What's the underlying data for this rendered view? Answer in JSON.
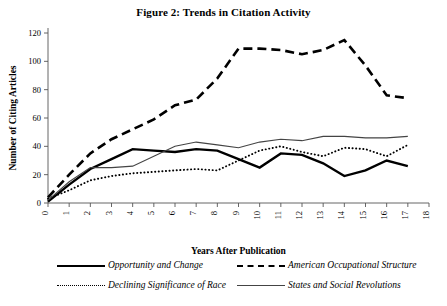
{
  "chart_data": {
    "type": "line",
    "title": "Figure 2: Trends in Citation Activity",
    "xlabel": "Years After Publication",
    "ylabel": "Number of Citing Articles",
    "xlim": [
      0,
      18
    ],
    "ylim": [
      0,
      120
    ],
    "xticks": [
      0,
      1,
      2,
      3,
      4,
      5,
      6,
      7,
      8,
      9,
      10,
      11,
      12,
      13,
      14,
      15,
      16,
      17,
      18
    ],
    "yticks": [
      0,
      20,
      40,
      60,
      80,
      100,
      120
    ],
    "xtick_labels": [
      "0",
      "1",
      "2",
      "3",
      "4",
      "5",
      "6",
      "7",
      "8",
      "9",
      "10",
      "11",
      "12",
      "13",
      "14",
      "15",
      "16",
      "17",
      "18"
    ],
    "ytick_labels": [
      "0",
      "20",
      "40",
      "60",
      "80",
      "100",
      "120"
    ],
    "grid": false,
    "legend_position": "below",
    "x": [
      0,
      1,
      2,
      3,
      4,
      5,
      6,
      7,
      8,
      9,
      10,
      11,
      12,
      13,
      14,
      15,
      16,
      17
    ],
    "series": [
      {
        "name": "Opportunity and Change",
        "style": "thick-solid",
        "color": "#000000",
        "values": [
          1,
          13,
          24,
          31,
          38,
          37,
          36,
          38,
          37,
          31,
          25,
          35,
          34,
          28,
          19,
          23,
          30,
          26
        ]
      },
      {
        "name": "American Occupational Structure",
        "style": "thick-dashed",
        "color": "#000000",
        "values": [
          4,
          20,
          35,
          45,
          52,
          59,
          69,
          73,
          88,
          109,
          109,
          108,
          105,
          108,
          115,
          97,
          76,
          74
        ]
      },
      {
        "name": "Declining Significance of Race",
        "style": "dotted",
        "color": "#000000",
        "values": [
          3,
          9,
          16,
          19,
          21,
          22,
          23,
          24,
          23,
          30,
          37,
          40,
          36,
          33,
          39,
          38,
          33,
          41
        ]
      },
      {
        "name": "States and Social Revolutions",
        "style": "thin-solid",
        "color": "#444444",
        "values": [
          2,
          15,
          25,
          25,
          26,
          33,
          40,
          43,
          41,
          39,
          43,
          45,
          44,
          47,
          47,
          46,
          46,
          47
        ]
      }
    ]
  },
  "legend": {
    "entries": [
      {
        "label": "Opportunity and Change",
        "style": "thick-solid"
      },
      {
        "label": "American Occupational Structure",
        "style": "thick-dashed"
      },
      {
        "label": "Declining Significance of Race",
        "style": "dotted"
      },
      {
        "label": "States and Social Revolutions",
        "style": "thin-solid"
      }
    ]
  }
}
